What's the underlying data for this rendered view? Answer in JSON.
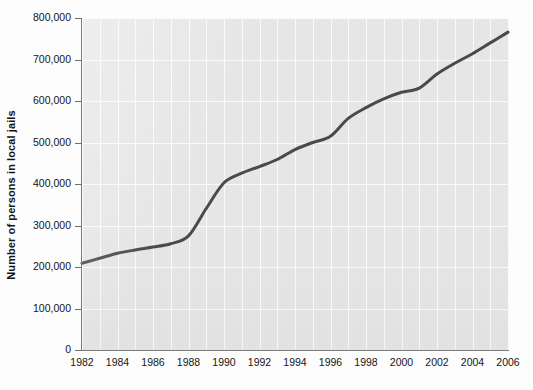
{
  "chart_data": {
    "type": "line",
    "title": "",
    "xlabel": "",
    "ylabel": "Number of persons in local jails",
    "xlim": [
      1982,
      2006
    ],
    "ylim": [
      0,
      800000
    ],
    "grid": true,
    "legend": false,
    "line_color": "#4a4a4a",
    "plot_background": "#e6e6e6",
    "gridline_color": "#fafafa",
    "x": [
      1982,
      1983,
      1984,
      1985,
      1986,
      1987,
      1988,
      1989,
      1990,
      1991,
      1992,
      1993,
      1994,
      1995,
      1996,
      1997,
      1998,
      1999,
      2000,
      2001,
      2002,
      2003,
      2004,
      2005,
      2006
    ],
    "values": [
      209000,
      221000,
      233000,
      241000,
      248000,
      256000,
      275000,
      341000,
      403000,
      426000,
      442000,
      459000,
      483000,
      500000,
      515000,
      558000,
      584000,
      605000,
      621000,
      631000,
      665000,
      691000,
      714000,
      740000,
      766000
    ],
    "y_ticks": [
      0,
      100000,
      200000,
      300000,
      400000,
      500000,
      600000,
      700000,
      800000
    ],
    "y_tick_labels": [
      "0",
      "100,000",
      "200,000",
      "300,000",
      "400,000",
      "500,000",
      "600,000",
      "700,000",
      "800,000"
    ],
    "x_ticks": [
      1982,
      1984,
      1986,
      1988,
      1990,
      1992,
      1994,
      1996,
      1998,
      2000,
      2002,
      2004,
      2006
    ],
    "x_tick_labels": [
      "1982",
      "1984",
      "1986",
      "1988",
      "1990",
      "1992",
      "1994",
      "1996",
      "1998",
      "2000",
      "2002",
      "2004",
      "2006"
    ],
    "x_minor_ticks": [
      1983,
      1985,
      1987,
      1989,
      1991,
      1993,
      1995,
      1997,
      1999,
      2001,
      2003,
      2005
    ]
  }
}
